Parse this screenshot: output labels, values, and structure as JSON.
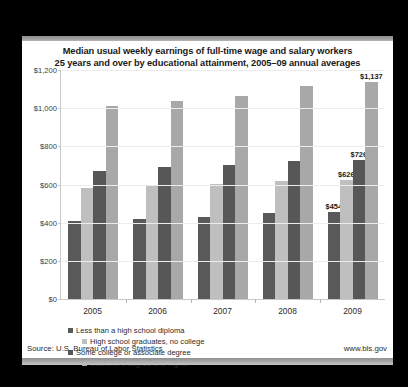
{
  "chart_data": {
    "type": "bar",
    "title": "Median usual weekly earnings of full-time wage and salary workers 25 years and over by educational attainment, 2005–09 annual averages",
    "title_line1": "Median usual weekly earnings of full-time wage and salary workers",
    "title_line2": "25 years and over by educational attainment, 2005–09 annual averages",
    "xlabel": "",
    "ylabel": "",
    "categories": [
      "2005",
      "2006",
      "2007",
      "2008",
      "2009"
    ],
    "ylim": [
      0,
      1200
    ],
    "yticks": [
      0,
      200,
      400,
      600,
      800,
      1000,
      1200
    ],
    "ytick_labels": [
      "$0",
      "$200",
      "$400",
      "$600",
      "$800",
      "$1,000",
      "$1,200"
    ],
    "grid": true,
    "legend_position": "bottom",
    "series": [
      {
        "name": "Less than a high school diploma",
        "color": "#595959",
        "values": [
          409,
          419,
          428,
          453,
          454
        ],
        "labels": [
          "",
          "",
          "",
          "",
          "$454"
        ]
      },
      {
        "name": "High school graduates, no college",
        "color": "#bfbfbf",
        "values": [
          583,
          595,
          604,
          618,
          626
        ],
        "labels": [
          "",
          "",
          "",
          "",
          "$626"
        ]
      },
      {
        "name": "Some college or associate  degree",
        "color": "#575757",
        "values": [
          672,
          690,
          704,
          722,
          726
        ],
        "labels": [
          "",
          "",
          "",
          "",
          "$726"
        ]
      },
      {
        "name": "Bachelor's degree and higher",
        "color": "#a8a8a8",
        "values": [
          1012,
          1039,
          1064,
          1115,
          1137
        ],
        "labels": [
          "",
          "",
          "",
          "",
          "$1,137"
        ]
      }
    ]
  },
  "footer": {
    "source": "Source: U.S. Bureau of Labor Statistics",
    "url": "www.bls.gov"
  },
  "colors": {
    "page_background": "#000000",
    "card_background": "#ffffff",
    "axis": "#c9c9c9",
    "gridline": "#ececec",
    "text": "#1a1a1a"
  }
}
